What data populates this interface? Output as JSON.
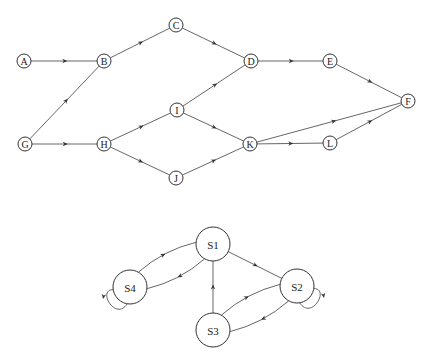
{
  "diagrams": [
    {
      "name": "directed-acyclic-graph",
      "node_radius": 7,
      "label_size": 10,
      "nodes": [
        {
          "id": "A",
          "label": "A",
          "x": 24,
          "y": 61
        },
        {
          "id": "B",
          "label": "B",
          "x": 104,
          "y": 61
        },
        {
          "id": "C",
          "label": "C",
          "x": 176,
          "y": 25
        },
        {
          "id": "D",
          "label": "D",
          "x": 251,
          "y": 61
        },
        {
          "id": "E",
          "label": "E",
          "x": 330,
          "y": 61
        },
        {
          "id": "F",
          "label": "F",
          "x": 408,
          "y": 101
        },
        {
          "id": "G",
          "label": "G",
          "x": 25,
          "y": 144
        },
        {
          "id": "H",
          "label": "H",
          "x": 104,
          "y": 144
        },
        {
          "id": "I",
          "label": "I",
          "x": 177,
          "y": 110
        },
        {
          "id": "J",
          "label": "J",
          "x": 176,
          "y": 178
        },
        {
          "id": "K",
          "label": "K",
          "x": 250,
          "y": 144
        },
        {
          "id": "L",
          "label": "L",
          "x": 330,
          "y": 143
        }
      ],
      "edges": [
        {
          "from": "A",
          "to": "B"
        },
        {
          "from": "G",
          "to": "B"
        },
        {
          "from": "G",
          "to": "H"
        },
        {
          "from": "B",
          "to": "C"
        },
        {
          "from": "C",
          "to": "D"
        },
        {
          "from": "H",
          "to": "I"
        },
        {
          "from": "H",
          "to": "J"
        },
        {
          "from": "I",
          "to": "D"
        },
        {
          "from": "I",
          "to": "K"
        },
        {
          "from": "J",
          "to": "K"
        },
        {
          "from": "D",
          "to": "E"
        },
        {
          "from": "E",
          "to": "F"
        },
        {
          "from": "K",
          "to": "F"
        },
        {
          "from": "K",
          "to": "L"
        },
        {
          "from": "L",
          "to": "F"
        }
      ]
    },
    {
      "name": "state-machine",
      "node_radius": 17,
      "label_size": 11,
      "nodes": [
        {
          "id": "S1",
          "label": "S1",
          "x": 213,
          "y": 244
        },
        {
          "id": "S2",
          "label": "S2",
          "x": 297,
          "y": 286
        },
        {
          "id": "S3",
          "label": "S3",
          "x": 213,
          "y": 330
        },
        {
          "id": "S4",
          "label": "S4",
          "x": 130,
          "y": 287
        }
      ],
      "edges": [
        {
          "from": "S4",
          "to": "S1",
          "curve": 8
        },
        {
          "from": "S1",
          "to": "S4",
          "curve": 8
        },
        {
          "from": "S1",
          "to": "S2",
          "curve": 0
        },
        {
          "from": "S3",
          "to": "S1",
          "curve": 0
        },
        {
          "from": "S3",
          "to": "S2",
          "curve": 8
        },
        {
          "from": "S2",
          "to": "S3",
          "curve": 8
        }
      ],
      "self_loops": [
        {
          "node": "S4",
          "side": "lower-left"
        },
        {
          "node": "S2",
          "side": "lower-right"
        }
      ]
    }
  ]
}
